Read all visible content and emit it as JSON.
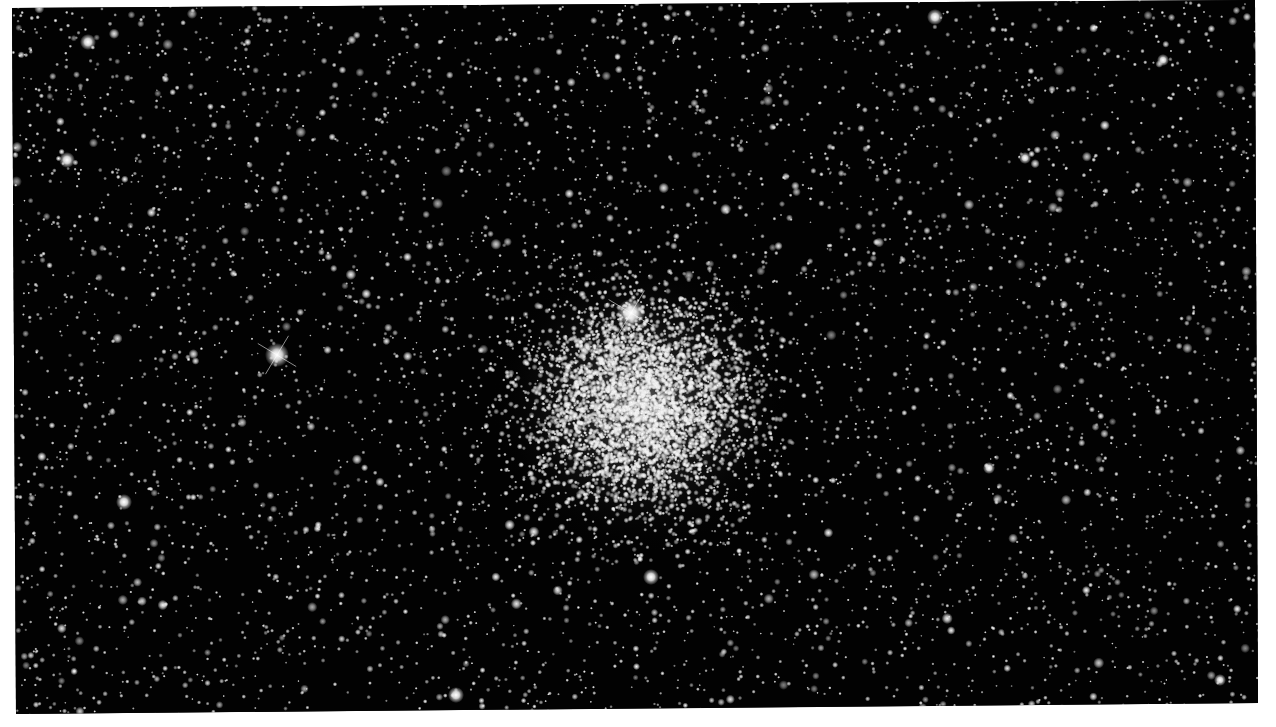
{
  "image": {
    "subject": "globular star cluster in a dense star field",
    "description": "Black-and-white astrophotograph of a dense globular cluster centered slightly right of middle, surrounded by a field of many stars; a few bright stars with diffraction spikes",
    "background_color": "#020202",
    "border_color": "#ffffff",
    "cluster_center": [
      640,
      405
    ],
    "bright_stars": [
      {
        "x": 631,
        "y": 313,
        "size": 7,
        "spikes": true
      },
      {
        "x": 277,
        "y": 355,
        "size": 6,
        "spikes": true
      },
      {
        "x": 67,
        "y": 160,
        "size": 4,
        "spikes": false
      },
      {
        "x": 88,
        "y": 42,
        "size": 4,
        "spikes": false
      },
      {
        "x": 935,
        "y": 17,
        "size": 4,
        "spikes": false
      },
      {
        "x": 124,
        "y": 502,
        "size": 4,
        "spikes": false
      },
      {
        "x": 651,
        "y": 577,
        "size": 4,
        "spikes": false
      },
      {
        "x": 456,
        "y": 695,
        "size": 4,
        "spikes": false
      },
      {
        "x": 1025,
        "y": 158,
        "size": 3,
        "spikes": false
      },
      {
        "x": 1163,
        "y": 60,
        "size": 3,
        "spikes": false
      },
      {
        "x": 989,
        "y": 468,
        "size": 3,
        "spikes": false
      },
      {
        "x": 1220,
        "y": 680,
        "size": 3,
        "spikes": false
      }
    ]
  }
}
